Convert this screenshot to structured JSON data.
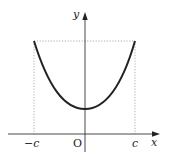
{
  "diagram": {
    "type": "function-graph",
    "curve": "U-shaped curve (catenary-like), symmetric about y-axis",
    "axes": {
      "x_label": "x",
      "y_label": "y",
      "origin_label": "O"
    },
    "x_ticks": [
      {
        "label": "−c",
        "position": "left"
      },
      {
        "label": "c",
        "position": "right"
      }
    ],
    "guides": "dotted vertical lines at x = −c and x = c, dotted horizontal line joining curve endpoints",
    "colors": {
      "curve": "#222222",
      "axis": "#333333",
      "guide": "#888888"
    }
  }
}
